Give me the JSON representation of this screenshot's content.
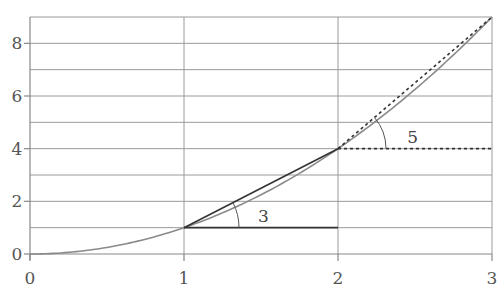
{
  "chart_data": {
    "type": "line",
    "title": "",
    "xlabel": "",
    "ylabel": "",
    "xlim": [
      0,
      3
    ],
    "ylim": [
      0,
      9
    ],
    "grid": true,
    "x_ticks": [
      0,
      1,
      2,
      3
    ],
    "x_tick_labels": [
      "0",
      "1",
      "2",
      "3"
    ],
    "y_ticks": [
      0,
      2,
      4,
      6,
      8
    ],
    "y_tick_labels": [
      "0",
      "2",
      "4",
      "6",
      "8"
    ],
    "y_gridlines": [
      1,
      2,
      3,
      4,
      5,
      6,
      7,
      8
    ],
    "x_gridlines": [
      1,
      2
    ],
    "series": [
      {
        "name": "curve y = x^2",
        "style": "solid",
        "color": "#8a8a8a",
        "x": [
          0,
          0.5,
          1,
          1.5,
          2,
          2.5,
          3
        ],
        "y": [
          0,
          0.25,
          1,
          2.25,
          4,
          6.25,
          9
        ]
      },
      {
        "name": "secant from (1,1) to (2,4)",
        "style": "solid",
        "color": "#333333",
        "x": [
          1,
          2
        ],
        "y": [
          1,
          4
        ],
        "slope": 3
      },
      {
        "name": "horizontal from (1,1)",
        "style": "solid",
        "color": "#333333",
        "x": [
          1,
          2
        ],
        "y": [
          1,
          1
        ]
      },
      {
        "name": "secant from (2,4) to (3,9)",
        "style": "dotted",
        "color": "#333333",
        "x": [
          2,
          3
        ],
        "y": [
          4,
          9
        ],
        "slope": 5
      },
      {
        "name": "horizontal from (2,4)",
        "style": "dotted",
        "color": "#333333",
        "x": [
          2,
          3
        ],
        "y": [
          4,
          4
        ]
      }
    ],
    "annotations": [
      {
        "text": "3",
        "type": "angle",
        "at": [
          1,
          1
        ],
        "label_pos": [
          1.48,
          1.45
        ]
      },
      {
        "text": "5",
        "type": "angle",
        "at": [
          2,
          4
        ],
        "label_pos": [
          2.45,
          4.45
        ]
      }
    ]
  }
}
